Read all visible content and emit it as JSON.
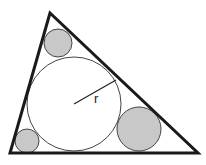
{
  "diagram": {
    "radius_label": "r",
    "colors": {
      "stroke": "#1a1a1a",
      "shaded_fill": "#c8c8c8",
      "incircle_fill": "#ffffff"
    },
    "triangle": {
      "points": [
        [
          50,
          13
        ],
        [
          10,
          153
        ],
        [
          198,
          153
        ]
      ]
    },
    "incircle": {
      "cx": 74,
      "cy": 104,
      "r": 47
    },
    "radius_line": {
      "x1": 74,
      "y1": 104,
      "x2": 116,
      "y2": 80
    },
    "small_circles": [
      {
        "name": "top",
        "cx": 58,
        "cy": 43,
        "r": 14
      },
      {
        "name": "bottom-left",
        "cx": 27,
        "cy": 141,
        "r": 12
      },
      {
        "name": "bottom-right",
        "cx": 139,
        "cy": 129,
        "r": 22
      }
    ]
  }
}
